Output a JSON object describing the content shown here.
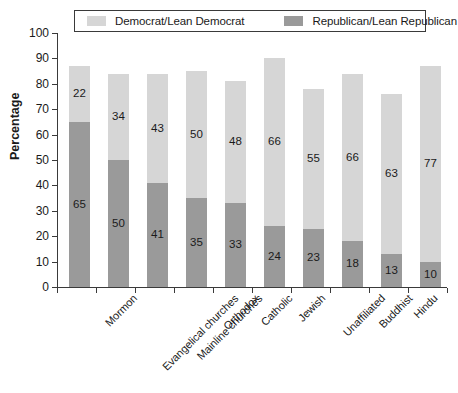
{
  "legend": {
    "entries": [
      {
        "label": "Democrat/Lean Democrat",
        "color": "#d6d6d6",
        "name": "legend-democrat"
      },
      {
        "label": "Republican/Lean Republican",
        "color": "#9a9a9a",
        "name": "legend-republican"
      }
    ]
  },
  "axis": {
    "y_title": "Percentage",
    "y_ticks": [
      "0",
      "10",
      "20",
      "30",
      "40",
      "50",
      "60",
      "70",
      "80",
      "90",
      "100"
    ]
  },
  "chart_data": {
    "type": "bar",
    "title": "",
    "xlabel": "",
    "ylabel": "Percentage",
    "ylim": [
      0,
      100
    ],
    "grid": false,
    "stacked": true,
    "legend_position": "top",
    "categories": [
      "Mormon",
      "Evangelical churches",
      "Mainline churches",
      "Orthodox",
      "Catholic",
      "Jewish",
      "Unaffiliated",
      "Buddhist",
      "Hindu",
      "Historically black churches"
    ],
    "category_lines": [
      [
        "Mormon"
      ],
      [
        "Evangelical churches"
      ],
      [
        "Mainline churches"
      ],
      [
        "Orthodox"
      ],
      [
        "Catholic"
      ],
      [
        "Jewish"
      ],
      [
        "Unaffiliated"
      ],
      [
        "Buddhist"
      ],
      [
        "Hindu"
      ],
      [
        "Historically",
        "black churches"
      ]
    ],
    "series": [
      {
        "name": "Republican/Lean Republican",
        "color": "#9a9a9a",
        "values": [
          65,
          50,
          41,
          35,
          33,
          24,
          23,
          18,
          13,
          10
        ]
      },
      {
        "name": "Democrat/Lean Democrat",
        "color": "#d6d6d6",
        "values": [
          22,
          34,
          43,
          50,
          48,
          66,
          55,
          66,
          63,
          77
        ]
      }
    ],
    "totals": [
      87,
      84,
      84,
      85,
      81,
      90,
      78,
      84,
      76,
      87
    ]
  }
}
